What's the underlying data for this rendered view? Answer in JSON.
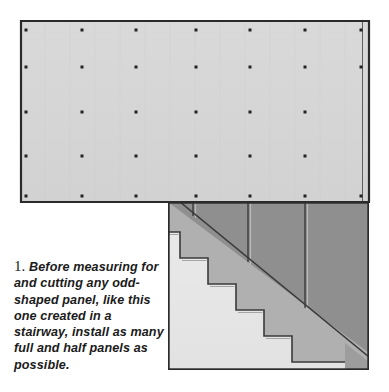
{
  "figure": {
    "background_color": "#ffffff"
  },
  "caption": {
    "number": "1.",
    "text": "Before measuring for and cutting any odd-shaped panel, like this one created in a stairway, install as many full and half panels as possible.",
    "text_color": "#1b1b1b"
  },
  "colors": {
    "panel_face": "#d5d5d5",
    "panel_edge": "#a8a8a8",
    "outline": "#2b2b2b",
    "wall_dark": "#8f8f8f",
    "wall_medium": "#b0b0b0",
    "stair_light": "#e6e6e6",
    "stair_shadow": "#c9c9c9",
    "fastener": "#222222",
    "background": "#ffffff"
  },
  "drywall_panel": {
    "name": "full drywall panel",
    "x": 21,
    "y": 21,
    "width": 348,
    "height": 181,
    "notch_x": 168,
    "notch_y": 202,
    "fastener_rows_y": [
      30,
      67,
      112,
      156,
      196
    ],
    "fastener_cols_x": [
      26,
      82,
      136,
      196,
      250,
      305,
      362
    ],
    "fastener_count": 33
  },
  "stair_area": {
    "name": "stairway opening",
    "x": 168,
    "y": 202,
    "width": 201,
    "height": 168,
    "stud_lines_x": [
      193,
      248,
      305
    ],
    "diagonal": {
      "from_x": 182,
      "from_y": 203,
      "to_x": 366,
      "to_y": 353
    },
    "steps": [
      {
        "tread_x": 180,
        "tread_y": 232,
        "riser_x": 208,
        "riser_y": 258
      },
      {
        "tread_x": 208,
        "tread_y": 258,
        "riser_x": 236,
        "riser_y": 284
      },
      {
        "tread_x": 236,
        "tread_y": 284,
        "riser_x": 264,
        "riser_y": 310
      },
      {
        "tread_x": 264,
        "tread_y": 310,
        "riser_x": 292,
        "riser_y": 336
      },
      {
        "tread_x": 292,
        "tread_y": 336,
        "riser_x": 320,
        "riser_y": 362
      }
    ],
    "step_count": 5
  }
}
